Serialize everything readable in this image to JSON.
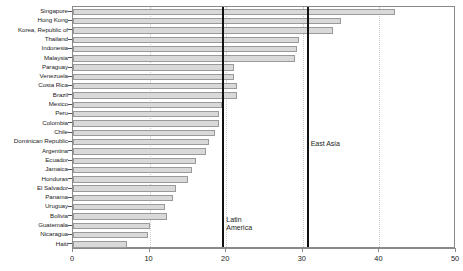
{
  "chart_data": {
    "type": "bar",
    "orientation": "horizontal",
    "title": "",
    "subtitle": "",
    "xlabel": "",
    "ylabel": "",
    "xlim": [
      0,
      50
    ],
    "ylim": null,
    "grid": true,
    "grid_style": "dotted-vertical",
    "xticks": [
      0,
      10,
      20,
      30,
      40,
      50
    ],
    "xtick_labels": [
      "0",
      "10",
      "20",
      "30",
      "40",
      "50"
    ],
    "legend": null,
    "legend_position": "none",
    "bar_color": "#d9d9d9",
    "bar_border_color": "#9a9a9a",
    "categories": [
      "Singapore",
      "Hong Kong",
      "Korea, Republic of",
      "Thailand",
      "Indonesia",
      "Malaysia",
      "Paraguay",
      "Venezuela",
      "Costa Rica",
      "Brazil",
      "Mexico",
      "Peru",
      "Colombia",
      "Chile",
      "Dominican Republic",
      "Argentina",
      "Ecuador",
      "Jamaica",
      "Honduras",
      "El Salvador",
      "Panama",
      "Uruguay",
      "Bolivia",
      "Guatemala",
      "Nicaragua",
      "Haiti"
    ],
    "values": [
      42.0,
      35.0,
      34.0,
      29.5,
      29.3,
      29.0,
      21.0,
      21.0,
      21.4,
      21.4,
      19.5,
      19.0,
      19.0,
      18.5,
      17.8,
      17.3,
      16.0,
      15.5,
      15.0,
      13.5,
      13.0,
      12.0,
      12.3,
      10.0,
      9.8,
      7.0
    ],
    "annotations": [
      {
        "label": "East Asia",
        "value": 30.5,
        "line_color": "#111111"
      },
      {
        "label": "Latin\nAmerica",
        "value": 19.5,
        "line_color": "#111111"
      }
    ]
  }
}
